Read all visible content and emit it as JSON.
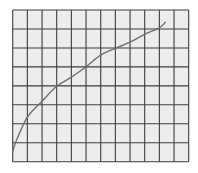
{
  "chart_data": {
    "type": "line",
    "title": "",
    "xlabel": "",
    "ylabel": "",
    "xlim": [
      0,
      12
    ],
    "ylim": [
      0,
      8
    ],
    "grid": true,
    "legend": null,
    "x_grid_count": 12,
    "y_grid_count": 8,
    "series": [
      {
        "name": "curve",
        "x": [
          0,
          0.19,
          1,
          2,
          3,
          4,
          5,
          6,
          7,
          8,
          9,
          10,
          10.4
        ],
        "values": [
          0.51,
          1.0,
          2.35,
          3.19,
          3.98,
          4.46,
          5.01,
          5.62,
          5.98,
          6.3,
          6.72,
          7.06,
          7.35
        ]
      }
    ]
  },
  "style": {
    "background": "#ffffff",
    "plot_background": "#ececec",
    "grid_color": "#3c3c3c",
    "curve_color": "#6e6e6e"
  }
}
